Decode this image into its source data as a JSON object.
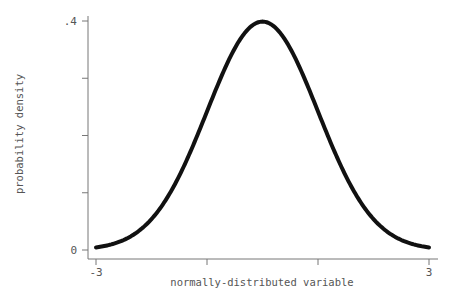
{
  "chart_data": {
    "type": "line",
    "title": "",
    "xlabel": "normally-distributed variable",
    "ylabel": "probability density",
    "xlim": [
      -3,
      3
    ],
    "ylim": [
      0,
      0.4
    ],
    "x_ticks": [
      -3,
      -1,
      1,
      3
    ],
    "x_tick_labels": [
      "-3",
      "",
      "",
      "3"
    ],
    "y_ticks": [
      0,
      0.1,
      0.2,
      0.3,
      0.4
    ],
    "y_tick_labels": [
      "0",
      "",
      "",
      "",
      ".4"
    ],
    "grid": false,
    "legend": null,
    "series": [
      {
        "name": "standard normal density",
        "x": [
          -3,
          -2.5,
          -2,
          -1.5,
          -1,
          -0.5,
          0,
          0.5,
          1,
          1.5,
          2,
          2.5,
          3
        ],
        "y": [
          0.0044,
          0.0175,
          0.054,
          0.1295,
          0.242,
          0.3521,
          0.3989,
          0.3521,
          0.242,
          0.1295,
          0.054,
          0.0175,
          0.0044
        ],
        "color": "#111111"
      }
    ]
  },
  "colors": {
    "curve": "#111111",
    "axis": "#777777",
    "text": "#555555",
    "background": "#ffffff"
  }
}
